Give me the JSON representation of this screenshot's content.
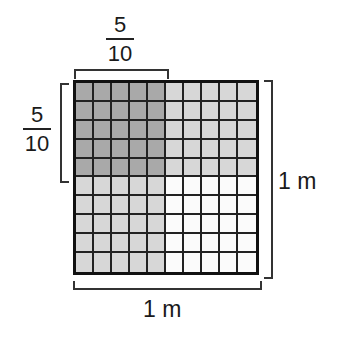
{
  "diagram": {
    "top_fraction": {
      "numerator": "5",
      "denominator": "10"
    },
    "left_fraction": {
      "numerator": "5",
      "denominator": "10"
    },
    "right_label": "1 m",
    "bottom_label": "1 m",
    "grid": {
      "rows": 10,
      "cols": 10,
      "shaded_dark": {
        "rows": 5,
        "cols": 5,
        "description": "top-left 5x5 overlap"
      },
      "shaded_light": "top 5 rows and left 5 columns outside overlap",
      "unshaded": "bottom-right 5x5"
    },
    "colors": {
      "dark": "#a9a9a9",
      "light": "#d7d7d7",
      "white": "#fbfbfb",
      "lines": "#222222"
    }
  }
}
